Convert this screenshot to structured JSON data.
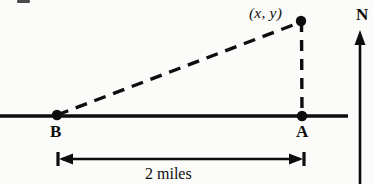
{
  "figure": {
    "type": "geometry-diagram",
    "background_color": "#fbfbfa",
    "ink_color": "#0d0d0d"
  },
  "labels": {
    "point_b": "B",
    "point_a": "A",
    "coordinate_point": "(x, y)",
    "dimension": "2 miles",
    "north": "N"
  },
  "geometry": {
    "baseline": {
      "x1": 0,
      "y1": 116,
      "x2": 348,
      "y2": 116
    },
    "point_b": {
      "x": 57,
      "y": 115
    },
    "point_a": {
      "x": 302,
      "y": 116
    },
    "point_xy": {
      "x": 301,
      "y": 21
    },
    "hypotenuse": {
      "x1": 57,
      "y1": 115,
      "x2": 301,
      "y2": 21,
      "style": "dashed"
    },
    "vertical_leg": {
      "x1": 301,
      "y1": 21,
      "x2": 302,
      "y2": 116,
      "style": "dashed"
    },
    "dimension_line": {
      "x1": 58,
      "y": 159,
      "x2": 304
    },
    "north_arrow": {
      "x": 360,
      "y_top": 30,
      "y_bottom": 184
    }
  }
}
